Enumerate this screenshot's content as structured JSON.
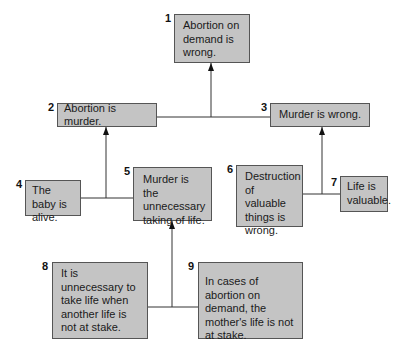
{
  "diagram": {
    "type": "argument-map",
    "statements": [
      {
        "id": "1",
        "text": "Abortion on demand is wrong."
      },
      {
        "id": "2",
        "text": "Abortion is murder."
      },
      {
        "id": "3",
        "text": "Murder is wrong."
      },
      {
        "id": "4",
        "text": "The baby is alive."
      },
      {
        "id": "5",
        "text": "Murder is the unnecessary taking of life."
      },
      {
        "id": "6",
        "text": "Destruction of valuable things is wrong."
      },
      {
        "id": "7",
        "text": "Life is valuable."
      },
      {
        "id": "8",
        "text": "It is unnecessary to take life when another life is not at stake."
      },
      {
        "id": "9",
        "text": "In cases of abortion on demand, the mother's life is not at stake."
      }
    ],
    "support_links": [
      {
        "from": [
          "2",
          "3"
        ],
        "to": "1"
      },
      {
        "from": [
          "4",
          "5"
        ],
        "to": "2"
      },
      {
        "from": [
          "6",
          "7"
        ],
        "to": "3"
      },
      {
        "from": [
          "8",
          "9"
        ],
        "to": "5"
      }
    ],
    "colors": {
      "box_fill": "#c4c4c4",
      "box_border": "#555555",
      "line": "#333333"
    }
  }
}
